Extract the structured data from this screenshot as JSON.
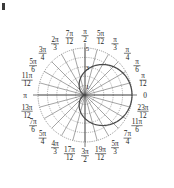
{
  "figure": {
    "type": "polar-plot",
    "corner_mark": "bullet-mark"
  },
  "chart_data": {
    "type": "line",
    "plot_kind": "polar",
    "title": "",
    "xlabel": "",
    "ylabel": "",
    "grid": true,
    "legend": null,
    "polar": {
      "center_x": 85,
      "center_y": 95,
      "outer_radius_px": 47,
      "r_max": 5,
      "radial_ticks": [
        1,
        2,
        3,
        4,
        5
      ],
      "radial_tick_labels": [
        "1",
        "3",
        "5"
      ],
      "radial_labeled_values": [
        1,
        3,
        5
      ],
      "angular_step": "pi/12",
      "angular_divisions": 24,
      "theta_zero_location": "E",
      "theta_direction": "counterclockwise"
    },
    "angle_labels": [
      {
        "value": "0",
        "num": "",
        "den": "",
        "theta_deg": 0,
        "plain": true
      },
      {
        "value": "pi/12",
        "num": "π",
        "den": "12",
        "theta_deg": 15,
        "plain": false
      },
      {
        "value": "pi/6",
        "num": "π",
        "den": "6",
        "theta_deg": 30,
        "plain": false
      },
      {
        "value": "pi/4",
        "num": "π",
        "den": "4",
        "theta_deg": 45,
        "plain": false
      },
      {
        "value": "pi/3",
        "num": "π",
        "den": "3",
        "theta_deg": 60,
        "plain": false
      },
      {
        "value": "5pi/12",
        "num": "5π",
        "den": "12",
        "theta_deg": 75,
        "plain": false
      },
      {
        "value": "pi/2",
        "num": "π",
        "den": "2",
        "theta_deg": 90,
        "plain": false
      },
      {
        "value": "7pi/12",
        "num": "7π",
        "den": "12",
        "theta_deg": 105,
        "plain": false
      },
      {
        "value": "2pi/3",
        "num": "2π",
        "den": "3",
        "theta_deg": 120,
        "plain": false
      },
      {
        "value": "3pi/4",
        "num": "3π",
        "den": "4",
        "theta_deg": 135,
        "plain": false
      },
      {
        "value": "5pi/6",
        "num": "5π",
        "den": "6",
        "theta_deg": 150,
        "plain": false
      },
      {
        "value": "11pi/12",
        "num": "11π",
        "den": "12",
        "theta_deg": 165,
        "plain": false
      },
      {
        "value": "pi",
        "num": "π",
        "den": "",
        "theta_deg": 180,
        "plain": true
      },
      {
        "value": "13pi/12",
        "num": "13π",
        "den": "12",
        "theta_deg": 195,
        "plain": false
      },
      {
        "value": "7pi/6",
        "num": "7π",
        "den": "6",
        "theta_deg": 210,
        "plain": false
      },
      {
        "value": "5pi/4",
        "num": "5π",
        "den": "4",
        "theta_deg": 225,
        "plain": false
      },
      {
        "value": "4pi/3",
        "num": "4π",
        "den": "3",
        "theta_deg": 240,
        "plain": false
      },
      {
        "value": "17pi/12",
        "num": "17π",
        "den": "12",
        "theta_deg": 255,
        "plain": false
      },
      {
        "value": "3pi/2",
        "num": "3π",
        "den": "2",
        "theta_deg": 270,
        "plain": false
      },
      {
        "value": "19pi/12",
        "num": "19π",
        "den": "12",
        "theta_deg": 285,
        "plain": false
      },
      {
        "value": "5pi/3",
        "num": "5π",
        "den": "3",
        "theta_deg": 300,
        "plain": false
      },
      {
        "value": "7pi/4",
        "num": "7π",
        "den": "4",
        "theta_deg": 315,
        "plain": false
      },
      {
        "value": "11pi/6",
        "num": "11π",
        "den": "6",
        "theta_deg": 330,
        "plain": false
      },
      {
        "value": "23pi/12",
        "num": "23π",
        "den": "12",
        "theta_deg": 345,
        "plain": false
      }
    ],
    "series": [
      {
        "name": "cardioid",
        "equation": "r = 2.5(1 + cos(theta))",
        "amplitude": 2.5,
        "r_at_theta": [
          {
            "theta_deg": 0,
            "r": 5.0
          },
          {
            "theta_deg": 15,
            "r": 4.91
          },
          {
            "theta_deg": 30,
            "r": 4.67
          },
          {
            "theta_deg": 45,
            "r": 4.27
          },
          {
            "theta_deg": 60,
            "r": 3.75
          },
          {
            "theta_deg": 75,
            "r": 3.15
          },
          {
            "theta_deg": 90,
            "r": 2.5
          },
          {
            "theta_deg": 105,
            "r": 1.85
          },
          {
            "theta_deg": 120,
            "r": 1.25
          },
          {
            "theta_deg": 135,
            "r": 0.73
          },
          {
            "theta_deg": 150,
            "r": 0.33
          },
          {
            "theta_deg": 165,
            "r": 0.09
          },
          {
            "theta_deg": 180,
            "r": 0.0
          },
          {
            "theta_deg": 195,
            "r": 0.09
          },
          {
            "theta_deg": 210,
            "r": 0.33
          },
          {
            "theta_deg": 225,
            "r": 0.73
          },
          {
            "theta_deg": 240,
            "r": 1.25
          },
          {
            "theta_deg": 255,
            "r": 1.85
          },
          {
            "theta_deg": 270,
            "r": 2.5
          },
          {
            "theta_deg": 285,
            "r": 3.15
          },
          {
            "theta_deg": 300,
            "r": 3.75
          },
          {
            "theta_deg": 315,
            "r": 4.27
          },
          {
            "theta_deg": 330,
            "r": 4.67
          },
          {
            "theta_deg": 345,
            "r": 4.91
          }
        ]
      }
    ],
    "colors": {
      "curve": "#4a4a4a",
      "grid": "#6b6b6b",
      "axis": "#3c3c3c",
      "text": "#1c1c1c",
      "background": "#ffffff"
    }
  }
}
